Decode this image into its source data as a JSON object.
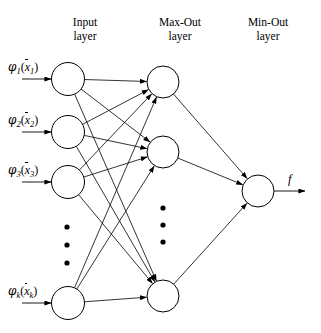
{
  "figure": {
    "width": 321,
    "height": 333,
    "background": "#ffffff",
    "stroke_color": "#000000"
  },
  "layers": {
    "titles": [
      {
        "id": "input",
        "line1": "Input",
        "line2": "layer",
        "x": 85,
        "y": 15
      },
      {
        "id": "maxout",
        "line1": "Max-Out",
        "line2": "layer",
        "x": 180,
        "y": 15
      },
      {
        "id": "minout",
        "line1": "Min-Out",
        "line2": "layer",
        "x": 268,
        "y": 15
      }
    ]
  },
  "input_layer": {
    "node_radius": 16.5,
    "nodes": [
      {
        "id": "in-1",
        "cx": 68,
        "cy": 79
      },
      {
        "id": "in-2",
        "cx": 68,
        "cy": 132
      },
      {
        "id": "in-3",
        "cx": 68,
        "cy": 182
      },
      {
        "id": "in-k",
        "cx": 68,
        "cy": 303
      }
    ],
    "ellipsis_dots": [
      {
        "cx": 67,
        "cy": 227
      },
      {
        "cx": 67,
        "cy": 245
      },
      {
        "cx": 67,
        "cy": 263
      }
    ],
    "labels": [
      {
        "id": "phi-1",
        "phi": "φ",
        "phi_sub": "1",
        "open": "(",
        "var": "x",
        "var_sub": "1",
        "close": ")",
        "x": 8,
        "y": 60
      },
      {
        "id": "phi-2",
        "phi": "φ",
        "phi_sub": "2",
        "open": "(",
        "var": "x",
        "var_sub": "2",
        "close": ")",
        "x": 8,
        "y": 113
      },
      {
        "id": "phi-3",
        "phi": "φ",
        "phi_sub": "3",
        "open": "(",
        "var": "x",
        "var_sub": "3",
        "close": ")",
        "x": 8,
        "y": 163
      },
      {
        "id": "phi-k",
        "phi": "φ",
        "phi_sub": "k",
        "open": "(",
        "var": "x",
        "var_sub": "k",
        "close": ")",
        "x": 8,
        "y": 284
      }
    ],
    "arrow_start_x": 22
  },
  "maxout_layer": {
    "node_radius": 16,
    "nodes": [
      {
        "id": "max-1",
        "cx": 163,
        "cy": 82
      },
      {
        "id": "max-2",
        "cx": 163,
        "cy": 152
      },
      {
        "id": "max-n",
        "cx": 163,
        "cy": 296
      }
    ],
    "ellipsis_dots": [
      {
        "cx": 163,
        "cy": 208
      },
      {
        "cx": 163,
        "cy": 225
      },
      {
        "cx": 163,
        "cy": 242
      }
    ]
  },
  "minout_layer": {
    "node_radius": 16,
    "nodes": [
      {
        "id": "min-1",
        "cx": 258,
        "cy": 191
      }
    ],
    "output_label": "f",
    "output_label_x": 288,
    "output_label_y": 172,
    "arrow_end_x": 305
  },
  "connections": {
    "input_to_maxout": [
      {
        "from": "in-1",
        "to": "max-1"
      },
      {
        "from": "in-1",
        "to": "max-2"
      },
      {
        "from": "in-1",
        "to": "max-n"
      },
      {
        "from": "in-2",
        "to": "max-1"
      },
      {
        "from": "in-2",
        "to": "max-2"
      },
      {
        "from": "in-2",
        "to": "max-n"
      },
      {
        "from": "in-3",
        "to": "max-1"
      },
      {
        "from": "in-3",
        "to": "max-2"
      },
      {
        "from": "in-3",
        "to": "max-n"
      },
      {
        "from": "in-k",
        "to": "max-1"
      },
      {
        "from": "in-k",
        "to": "max-2"
      },
      {
        "from": "in-k",
        "to": "max-n"
      }
    ],
    "maxout_to_minout": [
      {
        "from": "max-1",
        "to": "min-1"
      },
      {
        "from": "max-2",
        "to": "min-1"
      },
      {
        "from": "max-n",
        "to": "min-1"
      }
    ]
  }
}
